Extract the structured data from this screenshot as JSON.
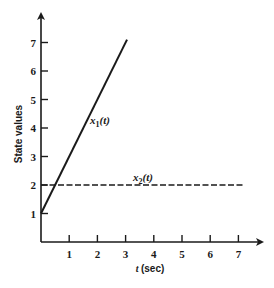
{
  "chart_data": {
    "type": "line",
    "title": "",
    "xlabel_var": "t",
    "xlabel_unit": "(sec)",
    "xlabel": "t (sec)",
    "ylabel": "State values",
    "xlim": [
      0,
      7.5
    ],
    "ylim": [
      0,
      7.6
    ],
    "xticks": [
      1,
      2,
      3,
      4,
      5,
      6,
      7
    ],
    "yticks": [
      1,
      2,
      3,
      4,
      5,
      6,
      7
    ],
    "grid": false,
    "legend": "none (inline labels)",
    "series": [
      {
        "name": "x1(t)",
        "label_var": "x",
        "label_sub": "1",
        "label_arg": "(t)",
        "style": "solid",
        "x": [
          0,
          3.05
        ],
        "y": [
          1,
          7.1
        ]
      },
      {
        "name": "x2(t)",
        "label_var": "x",
        "label_sub": "2",
        "label_arg": "(t)",
        "style": "dashed",
        "x": [
          0,
          7.2
        ],
        "y": [
          2,
          2
        ]
      }
    ]
  },
  "colors": {
    "ink": "#1a1a1a",
    "background": "#ffffff"
  }
}
